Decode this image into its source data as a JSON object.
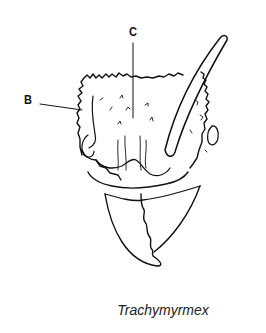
{
  "figure": {
    "labels": [
      {
        "id": "B",
        "text": "B"
      },
      {
        "id": "C",
        "text": "C"
      }
    ],
    "caption": "Trachymyrmex",
    "colors": {
      "line": "#111111",
      "background": "#ffffff"
    }
  }
}
